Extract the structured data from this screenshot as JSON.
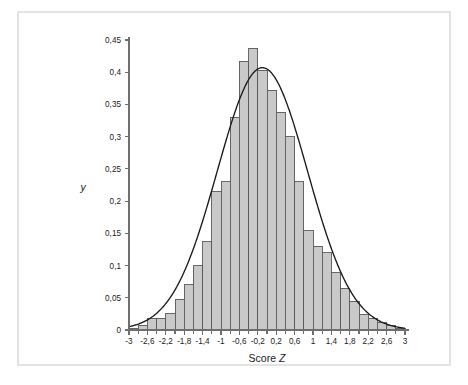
{
  "figure": {
    "background_color": "#ffffff",
    "frame_color": "#e3e3e3",
    "bar_fill_color": "#c9c9c9",
    "bar_stroke_color": "#595959",
    "curve_color": "#1a1a1a",
    "axis_color": "#6e6e6e",
    "text_color": "#1a1a1a"
  },
  "chart_data": {
    "type": "bar",
    "title": "",
    "subtitle": "",
    "xlabel": "Score Z",
    "ylabel": "y",
    "xlim": [
      -3,
      3
    ],
    "ylim": [
      0,
      0.45
    ],
    "grid": false,
    "legend": null,
    "decimal_separator": ",",
    "bin_width": 0.2,
    "x_tick_labels": [
      "-3",
      "-2,6",
      "-2,2",
      "-1,8",
      "-1,4",
      "-1",
      "-0,6",
      "-0,2",
      "0,2",
      "0,6",
      "1",
      "1,4",
      "1,8",
      "2,2",
      "2,6",
      "3"
    ],
    "x_tick_values": [
      -3,
      -2.6,
      -2.2,
      -1.8,
      -1.4,
      -1,
      -0.6,
      -0.2,
      0.2,
      0.6,
      1,
      1.4,
      1.8,
      2.2,
      2.6,
      3
    ],
    "x_minor_tick_values": [
      -2.8,
      -2.4,
      -2.0,
      -1.6,
      -1.2,
      -0.8,
      -0.4,
      0.0,
      0.4,
      0.8,
      1.2,
      1.6,
      2.0,
      2.4,
      2.8
    ],
    "y_tick_labels": [
      "0",
      "0,05",
      "0,1",
      "0,15",
      "0,2",
      "0,25",
      "0,3",
      "0,35",
      "0,4",
      "0,45"
    ],
    "y_tick_values": [
      0,
      0.05,
      0.1,
      0.15,
      0.2,
      0.25,
      0.3,
      0.35,
      0.4,
      0.45
    ],
    "categories": [
      "-3,0",
      "-2,8",
      "-2,6",
      "-2,4",
      "-2,2",
      "-2,0",
      "-1,8",
      "-1,6",
      "-1,4",
      "-1,2",
      "-1,0",
      "-0,8",
      "-0,6",
      "-0,4",
      "-0,2",
      "0,0",
      "0,2",
      "0,4",
      "0,6",
      "0,8",
      "1,0",
      "1,2",
      "1,4",
      "1,6",
      "1,8",
      "2,0",
      "2,2",
      "2,4",
      "2,6",
      "2,8"
    ],
    "bin_left_edges": [
      -3.0,
      -2.8,
      -2.6,
      -2.4,
      -2.2,
      -2.0,
      -1.8,
      -1.6,
      -1.4,
      -1.2,
      -1.0,
      -0.8,
      -0.6,
      -0.4,
      -0.2,
      0.0,
      0.2,
      0.4,
      0.6,
      0.8,
      1.0,
      1.2,
      1.4,
      1.6,
      1.8,
      2.0,
      2.2,
      2.4,
      2.6,
      2.8
    ],
    "values": [
      0.003,
      0.007,
      0.018,
      0.018,
      0.025,
      0.048,
      0.07,
      0.1,
      0.137,
      0.215,
      0.23,
      0.33,
      0.417,
      0.437,
      0.403,
      0.372,
      0.338,
      0.3,
      0.23,
      0.154,
      0.13,
      0.12,
      0.089,
      0.065,
      0.045,
      0.024,
      0.018,
      0.012,
      0.007,
      0.003
    ],
    "overlay_curve": {
      "name": "normal-density",
      "type": "line",
      "mean": -0.1,
      "std_dev": 0.98,
      "peak_value": 0.408,
      "description": "Normal density curve overlay"
    }
  }
}
